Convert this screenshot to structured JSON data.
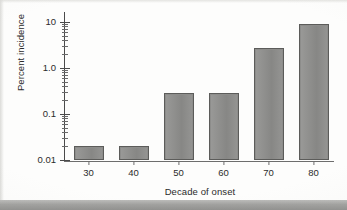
{
  "chart_data": {
    "type": "bar",
    "title": "",
    "subtitle": "",
    "xlabel": "Decade of onset",
    "ylabel": "Percent incidence",
    "categories": [
      "30",
      "40",
      "50",
      "60",
      "70",
      "80"
    ],
    "values": [
      0.02,
      0.02,
      0.29,
      0.28,
      2.7,
      9.0
    ],
    "series": [
      {
        "name": "Percent incidence",
        "values": [
          0.02,
          0.02,
          0.29,
          0.28,
          2.7,
          9.0
        ]
      }
    ],
    "yscale": "log",
    "ylim": [
      0.01,
      13
    ],
    "ytick_labels": [
      "10",
      "1.0",
      "0.1",
      "0.01"
    ],
    "ytick_values": [
      10,
      1.0,
      0.1,
      0.01
    ],
    "xtick_labels": [
      "30",
      "40",
      "50",
      "60",
      "70",
      "80"
    ],
    "grid": false,
    "legend": null,
    "bar_color": "#8d8d8b",
    "bar_edge_color": "#5c5c5a",
    "axis_color": "#4a4a4a",
    "background_color": "#fdfdfc"
  },
  "figure": {
    "alt_name": "log-scale-bar-chart",
    "minor_ticks_per_decade": 8
  }
}
